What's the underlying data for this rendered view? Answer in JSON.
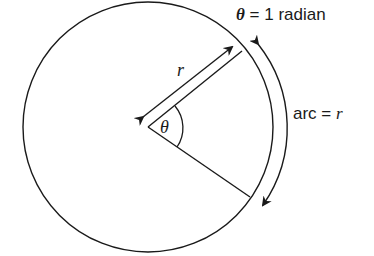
{
  "title": {
    "theta_symbol": "θ",
    "equals_text": " = 1 radian"
  },
  "labels": {
    "radius": "r",
    "angle": "θ",
    "arc_prefix": "arc = ",
    "arc_value": "r"
  },
  "colors": {
    "stroke": "#1a1a1a",
    "background": "#ffffff"
  }
}
